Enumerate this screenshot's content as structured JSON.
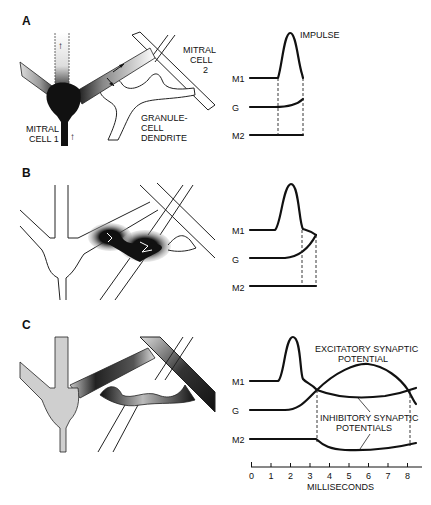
{
  "figure": {
    "panels": [
      {
        "id": "A",
        "letter": "A",
        "labels": {
          "mitral_cell_1_line1": "MITRAL",
          "mitral_cell_1_line2": "CELL 1",
          "mitral_cell_2_line1": "MITRAL",
          "mitral_cell_2_line2": "CELL",
          "mitral_cell_2_line3": "2",
          "granule_line1": "GRANULE-",
          "granule_line2": "CELL",
          "granule_line3": "DENDRITE",
          "impulse": "IMPULSE"
        },
        "traces": [
          "M1",
          "G",
          "M2"
        ]
      },
      {
        "id": "B",
        "letter": "B",
        "traces": [
          "M1",
          "G",
          "M2"
        ]
      },
      {
        "id": "C",
        "letter": "C",
        "labels": {
          "excitatory_line1": "EXCITATORY SYNAPTIC",
          "excitatory_line2": "POTENTIAL",
          "inhibitory_line1": "INHIBITORY SYNAPTIC",
          "inhibitory_line2": "POTENTIALS"
        },
        "traces": [
          "M1",
          "G",
          "M2"
        ]
      }
    ],
    "trace_labels": {
      "m1": "M1",
      "g": "G",
      "m2": "M2"
    },
    "axis": {
      "label": "MILLISECONDS",
      "ticks": [
        "0",
        "1",
        "2",
        "3",
        "4",
        "5",
        "6",
        "7",
        "8"
      ]
    }
  }
}
